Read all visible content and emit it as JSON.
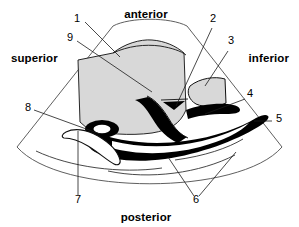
{
  "figure": {
    "modality": "ultrasound-sector-scan",
    "background_color": "#ffffff",
    "ink_color": "#000000",
    "fill_gray": "#d8d8d8",
    "fill_black": "#000000",
    "fill_white": "#ffffff"
  },
  "orientation_labels": {
    "top": "anterior",
    "left": "superior",
    "right": "inferior",
    "bottom": "posterior"
  },
  "number_labels": [
    {
      "id": "1",
      "text": "1",
      "x": 77,
      "y": 22
    },
    {
      "id": "2",
      "text": "2",
      "x": 213,
      "y": 22
    },
    {
      "id": "3",
      "text": "3",
      "x": 231,
      "y": 44
    },
    {
      "id": "4",
      "text": "4",
      "x": 250,
      "y": 97
    },
    {
      "id": "5",
      "text": "5",
      "x": 279,
      "y": 122
    },
    {
      "id": "6",
      "text": "6",
      "x": 196,
      "y": 202
    },
    {
      "id": "7",
      "text": "7",
      "x": 78,
      "y": 202
    },
    {
      "id": "8",
      "text": "8",
      "x": 28,
      "y": 111
    },
    {
      "id": "9",
      "text": "9",
      "x": 70,
      "y": 41
    }
  ],
  "leader_lines": [
    {
      "from": "1",
      "path": "M 86 21 L 119 56"
    },
    {
      "from": "9",
      "path": "M 78 40 L 152 91"
    },
    {
      "from": "2",
      "path": "M 212 27 L 178 107"
    },
    {
      "from": "3",
      "path": "M 228 50 L 205 87"
    },
    {
      "from": "4",
      "path": "M 246 99 L 206 115"
    },
    {
      "from": "5",
      "path": "M 273 121 L 255 121"
    },
    {
      "from": "6a",
      "path": "M 195 196 L 170 158"
    },
    {
      "from": "6b",
      "path": "M 199 196 L 235 153"
    },
    {
      "from": "7",
      "path": "M 78 195 L 78 131"
    },
    {
      "from": "8",
      "path": "M 35 110 L 98 133"
    }
  ],
  "sector": {
    "apex_x": 150,
    "apex_y": -52,
    "left_edge": "M 112 25 L 18 146",
    "right_edge": "M 188 25 L 281 146",
    "near_arc": "M 112 25 A 135 135 0 0 1 188 25",
    "far_arc": "M 18 146 A 175 175 0 0 0 281 146"
  },
  "structures": [
    {
      "name": "bladder",
      "label_ref": "1",
      "fill": "#d8d8d8",
      "description": "large gray anterior region"
    },
    {
      "name": "vessel-branch",
      "label_ref": "2",
      "fill": "#000000",
      "description": "small dark triangular vessel lumen"
    },
    {
      "name": "soft-tissue-lobe",
      "label_ref": "3",
      "fill": "#ffffff",
      "description": "outlined lobe to the inferior side"
    },
    {
      "name": "vessel-segment",
      "label_ref": "4",
      "fill": "#000000",
      "description": "short black band"
    },
    {
      "name": "vessel-tail",
      "label_ref": "5",
      "fill": "#000000",
      "description": "black band tapering to right edge"
    },
    {
      "name": "acoustic-shadow-lines",
      "label_ref": "6",
      "fill": "none",
      "description": "curved lines posterior to vessel"
    },
    {
      "name": "muscle-layer",
      "label_ref": "7",
      "fill": "#ffffff",
      "description": "crescent outline at lower left"
    },
    {
      "name": "duct-ring",
      "label_ref": "8",
      "fill": "#000000",
      "description": "black ring with white lumen"
    },
    {
      "name": "tissue-interface",
      "label_ref": "9",
      "fill": "none",
      "description": "boundary line within bladder wall"
    }
  ]
}
